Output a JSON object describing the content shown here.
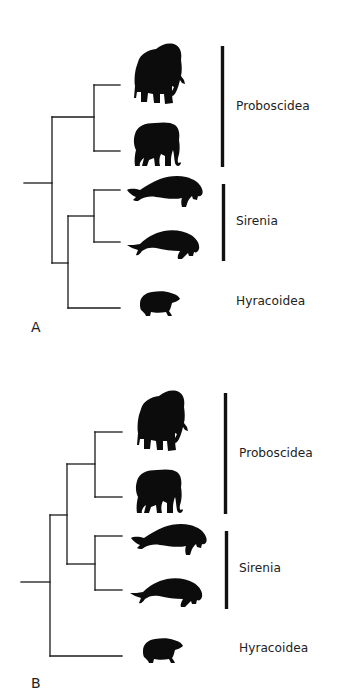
{
  "figure": {
    "background": "#ffffff",
    "ink_color": "#111111",
    "panels": [
      {
        "id": "A",
        "label": "A",
        "topology": "(((Mammoth, Elephant), (Sirenian1, Sirenian2)), Hyracoidea) arranged as ((Proboscidea), ((Sirenia), Hyracoidea))",
        "newick": "((Mammoth,Elephant),((Sirenian1,Sirenian2),Hyrax));",
        "taxa": [
          {
            "name": "mammoth",
            "icon": "mammoth-silhouette"
          },
          {
            "name": "elephant",
            "icon": "elephant-silhouette"
          },
          {
            "name": "sirenian-1",
            "icon": "manatee-silhouette"
          },
          {
            "name": "sirenian-2",
            "icon": "dugong-silhouette"
          },
          {
            "name": "hyrax",
            "icon": "hyrax-silhouette"
          }
        ],
        "clades": [
          {
            "label": "Proboscidea",
            "bar": true
          },
          {
            "label": "Sirenia",
            "bar": true
          },
          {
            "label": "Hyracoidea",
            "bar": false
          }
        ]
      },
      {
        "id": "B",
        "label": "B",
        "newick": "(((Mammoth,Elephant),(Sirenian1,Sirenian2)),Hyrax);",
        "taxa": [
          {
            "name": "mammoth",
            "icon": "mammoth-silhouette"
          },
          {
            "name": "elephant",
            "icon": "elephant-silhouette"
          },
          {
            "name": "sirenian-1",
            "icon": "manatee-silhouette"
          },
          {
            "name": "sirenian-2",
            "icon": "dugong-silhouette"
          },
          {
            "name": "hyrax",
            "icon": "hyrax-silhouette"
          }
        ],
        "clades": [
          {
            "label": "Proboscidea",
            "bar": true
          },
          {
            "label": "Sirenia",
            "bar": true
          },
          {
            "label": "Hyracoidea",
            "bar": false
          }
        ]
      }
    ]
  }
}
